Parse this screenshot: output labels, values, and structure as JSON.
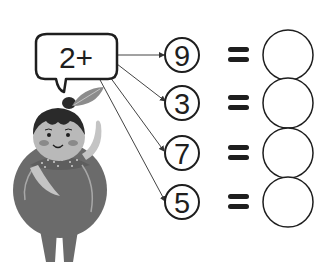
{
  "worksheet": {
    "bubble": {
      "operator_text": "2+"
    },
    "rows": [
      {
        "number": "9",
        "equals": "=",
        "answer": ""
      },
      {
        "number": "3",
        "equals": "=",
        "answer": ""
      },
      {
        "number": "7",
        "equals": "=",
        "answer": ""
      },
      {
        "number": "5",
        "equals": "=",
        "answer": ""
      }
    ],
    "colors": {
      "ink": "#1e1e1e",
      "body": "#6b6b6b",
      "skin": "#b9b9b9",
      "hair": "#2a2a2a",
      "cheek": "#8a8a8a",
      "leaf": "#8c8c8c"
    }
  }
}
